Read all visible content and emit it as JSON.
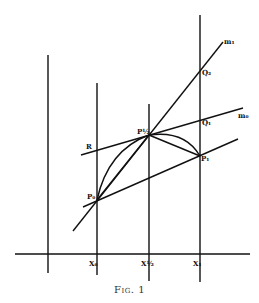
{
  "figure": {
    "caption": "Fig. 1",
    "labels": {
      "m1": "m₁",
      "m0": "m₀",
      "Q2": "Q₂",
      "Q1": "Q₁",
      "P1": "P₁",
      "Pm": "P½",
      "P0": "P₀",
      "R": "R",
      "X0": "X₀",
      "Xm": "X½",
      "X1": "X₁"
    },
    "colors": {
      "ink": "#111111",
      "paper": "#ffffff"
    }
  }
}
